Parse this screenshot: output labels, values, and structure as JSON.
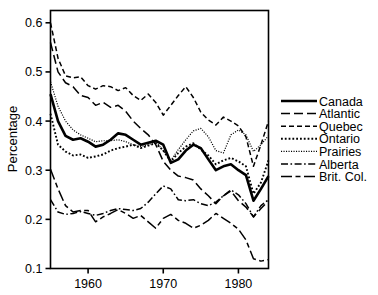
{
  "chart_data": {
    "type": "line",
    "title": "",
    "xlabel": "",
    "ylabel": "Percentage",
    "xlim": [
      1955,
      1984
    ],
    "ylim": [
      0.1,
      0.625
    ],
    "grid": false,
    "legend_position": "right",
    "xticks": [
      "1960",
      "1970",
      "1980"
    ],
    "xtick_values": [
      1960,
      1970,
      1980
    ],
    "yticks": [
      "0.1",
      "0.2",
      "0.3",
      "0.4",
      "0.5",
      "0.6"
    ],
    "ytick_values": [
      0.1,
      0.2,
      0.3,
      0.4,
      0.5,
      0.6
    ],
    "x": [
      1955,
      1956,
      1957,
      1958,
      1959,
      1960,
      1961,
      1962,
      1963,
      1964,
      1965,
      1966,
      1967,
      1968,
      1969,
      1970,
      1971,
      1972,
      1973,
      1974,
      1975,
      1976,
      1977,
      1978,
      1979,
      1980,
      1981,
      1982,
      1983,
      1984
    ],
    "series": [
      {
        "name": "Canada",
        "style": "solid",
        "values": [
          0.455,
          0.4,
          0.37,
          0.362,
          0.365,
          0.358,
          0.348,
          0.352,
          0.362,
          0.375,
          0.372,
          0.362,
          0.352,
          0.356,
          0.36,
          0.352,
          0.315,
          0.322,
          0.34,
          0.352,
          0.345,
          0.322,
          0.3,
          0.308,
          0.312,
          0.3,
          0.29,
          0.238,
          0.262,
          0.288
        ]
      },
      {
        "name": "Atlantic",
        "style": "long-dash",
        "values": [
          0.56,
          0.5,
          0.478,
          0.47,
          0.452,
          0.448,
          0.432,
          0.438,
          0.428,
          0.432,
          0.42,
          0.4,
          0.385,
          0.372,
          0.352,
          0.318,
          0.3,
          0.288,
          0.285,
          0.28,
          0.262,
          0.248,
          0.232,
          0.248,
          0.258,
          0.238,
          0.225,
          0.205,
          0.222,
          0.238
        ]
      },
      {
        "name": "Quebec",
        "style": "dash",
        "values": [
          0.6,
          0.528,
          0.492,
          0.488,
          0.49,
          0.472,
          0.465,
          0.472,
          0.47,
          0.462,
          0.468,
          0.452,
          0.442,
          0.455,
          0.438,
          0.412,
          0.432,
          0.452,
          0.47,
          0.448,
          0.418,
          0.402,
          0.392,
          0.408,
          0.4,
          0.39,
          0.368,
          0.308,
          0.352,
          0.4
        ]
      },
      {
        "name": "Ontario",
        "style": "dot",
        "values": [
          0.415,
          0.352,
          0.338,
          0.33,
          0.332,
          0.325,
          0.328,
          0.332,
          0.34,
          0.345,
          0.348,
          0.352,
          0.345,
          0.35,
          0.355,
          0.34,
          0.318,
          0.335,
          0.348,
          0.355,
          0.342,
          0.33,
          0.312,
          0.32,
          0.325,
          0.318,
          0.308,
          0.252,
          0.275,
          0.32
        ]
      },
      {
        "name": "Prairies",
        "style": "fine-dot",
        "values": [
          0.48,
          0.43,
          0.4,
          0.382,
          0.372,
          0.365,
          0.358,
          0.36,
          0.36,
          0.362,
          0.358,
          0.352,
          0.348,
          0.352,
          0.358,
          0.34,
          0.32,
          0.342,
          0.362,
          0.38,
          0.385,
          0.368,
          0.34,
          0.335,
          0.372,
          0.382,
          0.372,
          0.338,
          0.352,
          0.37
        ]
      },
      {
        "name": "Alberta",
        "style": "dash-dot",
        "values": [
          0.24,
          0.215,
          0.21,
          0.212,
          0.216,
          0.212,
          0.208,
          0.212,
          0.218,
          0.222,
          0.22,
          0.218,
          0.222,
          0.235,
          0.252,
          0.268,
          0.262,
          0.24,
          0.238,
          0.24,
          0.232,
          0.228,
          0.235,
          0.248,
          0.26,
          0.25,
          0.232,
          0.205,
          0.228,
          0.24
        ]
      },
      {
        "name": "Brit. Col.",
        "style": "long-dash-dot",
        "values": [
          0.302,
          0.262,
          0.228,
          0.215,
          0.218,
          0.218,
          0.195,
          0.205,
          0.212,
          0.22,
          0.212,
          0.202,
          0.208,
          0.195,
          0.182,
          0.202,
          0.21,
          0.198,
          0.192,
          0.182,
          0.188,
          0.198,
          0.212,
          0.202,
          0.192,
          0.18,
          0.158,
          0.12,
          0.115,
          0.118
        ]
      }
    ]
  },
  "legend": {
    "entries": [
      {
        "label": "Canada"
      },
      {
        "label": "Atlantic"
      },
      {
        "label": "Quebec"
      },
      {
        "label": "Ontario"
      },
      {
        "label": "Prairies"
      },
      {
        "label": "Alberta"
      },
      {
        "label": "Brit. Col."
      }
    ]
  },
  "colors": {
    "line": "#000000",
    "axis": "#000000",
    "background": "#ffffff"
  }
}
